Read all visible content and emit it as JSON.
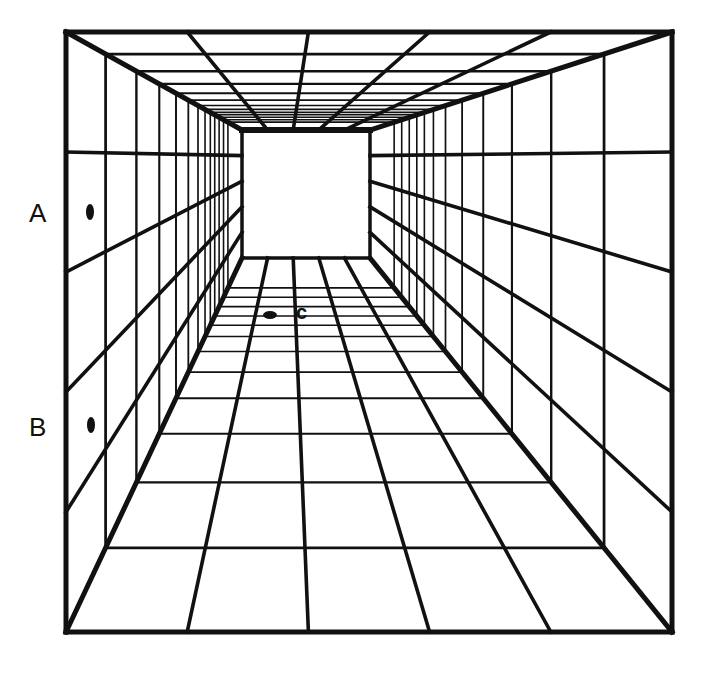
{
  "figure": {
    "type": "one-point perspective corridor illusion",
    "colors": {
      "background": "#ffffff",
      "ink": "#111111"
    },
    "outer_frame": {
      "left": 66,
      "top": 32,
      "right": 672,
      "bottom": 632
    },
    "back_wall": {
      "left": 242,
      "top": 130,
      "right": 370,
      "bottom": 258
    },
    "depth_fractions": [
      0,
      0.225,
      0.4,
      0.53,
      0.625,
      0.695,
      0.75,
      0.79,
      0.82,
      0.845,
      0.87,
      0.895,
      0.92,
      1
    ],
    "wall_rows": 5,
    "floor_columns": 5,
    "ceiling_columns": 5
  },
  "labels": {
    "a": {
      "text": "A",
      "x": 29,
      "y": 200
    },
    "b": {
      "text": "B",
      "x": 29,
      "y": 414
    },
    "c": {
      "text": "c",
      "x": 296,
      "y": 302
    }
  },
  "markers": {
    "a": {
      "cx": 90,
      "cy": 212,
      "rx": 4,
      "ry": 8
    },
    "b": {
      "cx": 91,
      "cy": 425,
      "rx": 4,
      "ry": 8
    },
    "c": {
      "cx": 270,
      "cy": 315,
      "rx": 7,
      "ry": 4
    }
  }
}
